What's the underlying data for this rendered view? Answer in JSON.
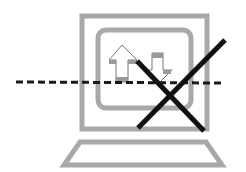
{
  "illustration": {
    "subject": "computer offline / no network connection",
    "icons": [
      "monitor-icon",
      "upload-arrow-icon",
      "download-arrow-icon",
      "dashed-connection-line-icon",
      "cross-out-icon",
      "keyboard-icon"
    ]
  },
  "colors": {
    "background": "#ffffff",
    "frame_gray": "#a8a8a8",
    "arrow_fill_gray": "#9a9a9a",
    "cross_black": "#111111",
    "dash_black": "#1a1a1a"
  }
}
